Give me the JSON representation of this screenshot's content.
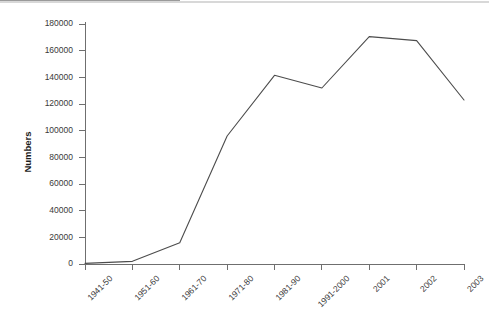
{
  "chart_data": {
    "type": "line",
    "title": "",
    "subtitle": "",
    "xlabel": "",
    "ylabel": "Numbers",
    "categories": [
      "1941-50",
      "1951-60",
      "1961-70",
      "1971-80",
      "1981-90",
      "1991-2000",
      "2001",
      "2002",
      "2003"
    ],
    "values": [
      500,
      2000,
      16000,
      96000,
      141500,
      132000,
      170500,
      167500,
      123000
    ],
    "series": [
      {
        "name": "Numbers",
        "values": [
          500,
          2000,
          16000,
          96000,
          141500,
          132000,
          170500,
          167500,
          123000
        ]
      }
    ],
    "ylim": [
      0,
      180000
    ],
    "ytick_values": [
      0,
      20000,
      40000,
      60000,
      80000,
      100000,
      120000,
      140000,
      160000,
      180000
    ],
    "ytick_labels": [
      "0",
      "20000",
      "40000",
      "60000",
      "80000",
      "100000",
      "120000",
      "140000",
      "160000",
      "180000"
    ],
    "grid": false,
    "legend": false,
    "legend_position": "none",
    "line_color": "#4c4c4c",
    "axis_color": "#6f6f6f",
    "text_color": "#3a3a3a",
    "background_color": "#ffffff",
    "xtick_label_rotation": "-45"
  }
}
